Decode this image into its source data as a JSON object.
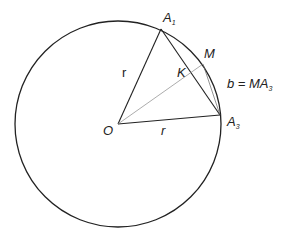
{
  "diagram": {
    "circle": {
      "center": "O",
      "cx": 118,
      "cy": 124,
      "r": 104
    },
    "points": {
      "O": {
        "label": "O",
        "x": 118,
        "y": 124
      },
      "A1": {
        "label": "A",
        "sub": "1",
        "x": 161,
        "y": 29
      },
      "M": {
        "label": "M",
        "x": 203,
        "y": 64
      },
      "K": {
        "label": "K",
        "x": 190,
        "y": 73
      },
      "A3": {
        "label": "A",
        "sub": "3",
        "x": 220,
        "y": 115
      }
    },
    "labels": {
      "radius_1": "r",
      "radius_2": "r",
      "equation_lhs": "b = MA",
      "equation_sub": "3"
    },
    "segments": [
      {
        "from": "O",
        "to": "A1",
        "label": "r"
      },
      {
        "from": "O",
        "to": "A3",
        "label": "r"
      },
      {
        "from": "A1",
        "to": "A3"
      },
      {
        "from": "O",
        "to": "M"
      },
      {
        "from": "M",
        "to": "A3"
      }
    ]
  }
}
